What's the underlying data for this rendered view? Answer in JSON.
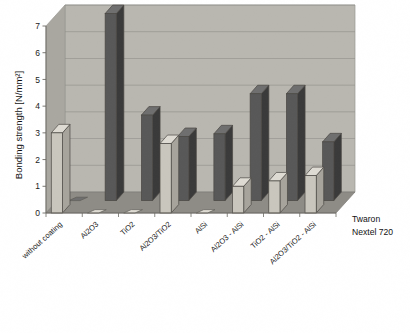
{
  "chart_data": {
    "type": "bar",
    "title": "",
    "subtitle": "",
    "xlabel": "",
    "ylabel": "Bonding strength [N/mm²]",
    "ylim": [
      0,
      7
    ],
    "yticks": [
      0,
      1,
      2,
      3,
      4,
      5,
      6,
      7
    ],
    "ytick_labels": [
      "0",
      "1",
      "2",
      "3",
      "4",
      "5",
      "6",
      "7"
    ],
    "grid": true,
    "grid_axis": "y",
    "projection": "3d-columns",
    "legend_position": "right-bottom",
    "categories": [
      "without coating",
      "Al2O3",
      "TiO2",
      "Al2O3/TiO2",
      "AlSi",
      "Al2O3 - AlSi",
      "TiO2 - AlSi",
      "Al2O3/TiO2 - AlSi"
    ],
    "series": [
      {
        "name": "Twaron",
        "color": "#c9c6bd",
        "values": [
          3.0,
          0.0,
          0.0,
          2.6,
          0.0,
          1.0,
          1.2,
          1.4
        ]
      },
      {
        "name": "Nextel 720",
        "color": "#585858",
        "values": [
          0.0,
          7.0,
          3.2,
          2.4,
          2.5,
          4.0,
          4.0,
          2.2
        ]
      }
    ]
  },
  "legend": {
    "entries": [
      {
        "label": "Twaron"
      },
      {
        "label": "Nextel 720"
      }
    ]
  },
  "axes": {
    "y_title": "Bonding strength [N/mm²]",
    "y_ticks": [
      "7",
      "6",
      "5",
      "4",
      "3",
      "2",
      "1",
      "0"
    ]
  },
  "colors": {
    "twaron_face": "#c9c6bd",
    "twaron_side": "#a7a49c",
    "twaron_top": "#dedbd3",
    "nextel_face": "#585858",
    "nextel_side": "#3a3a3a",
    "nextel_top": "#6f6f6f",
    "back_wall": "#b9b7b0",
    "side_wall": "#a9a7a0",
    "floor": "#8e8c86",
    "floor_front": "#7b7974",
    "gridline": "#8e8c86",
    "axis_line": "#6b6963",
    "background": "#ffffff"
  }
}
